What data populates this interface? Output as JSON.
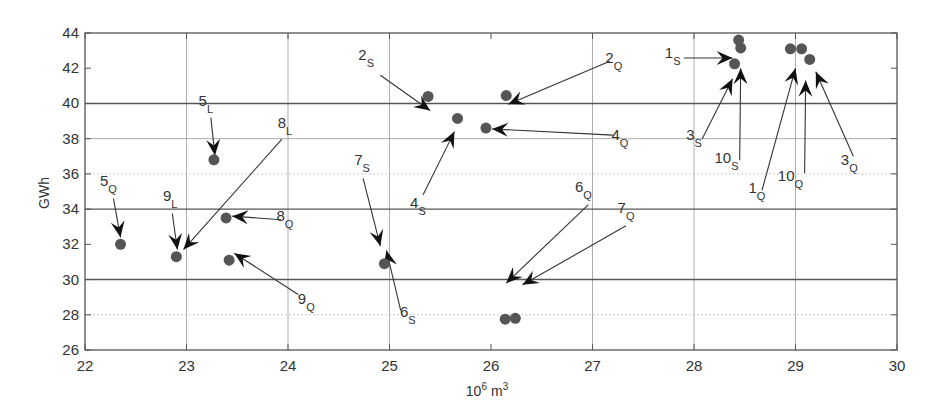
{
  "chart_data": {
    "type": "scatter",
    "title": "",
    "xlabel": "10^6 m^3",
    "xlabel_base": "10",
    "xlabel_exp": "6",
    "xlabel_unit": "m",
    "xlabel_unit_exp": "3",
    "ylabel": "GWh",
    "xlim": [
      22,
      30
    ],
    "ylim": [
      26,
      44
    ],
    "xticks": [
      22,
      23,
      24,
      25,
      26,
      27,
      28,
      29,
      30
    ],
    "yticks": [
      26,
      28,
      30,
      32,
      34,
      36,
      38,
      40,
      42,
      44
    ],
    "grid": {
      "x_lines": [
        23,
        24,
        25,
        27,
        28,
        29
      ],
      "y_heavy": [
        30,
        34,
        40
      ],
      "y_light": [
        38
      ],
      "y_dotted": [
        28,
        36
      ]
    },
    "legend": null,
    "points": [
      {
        "x": 22.35,
        "y": 32.0
      },
      {
        "x": 22.9,
        "y": 31.3
      },
      {
        "x": 23.27,
        "y": 36.8
      },
      {
        "x": 23.39,
        "y": 33.5
      },
      {
        "x": 23.42,
        "y": 31.1
      },
      {
        "x": 24.95,
        "y": 30.9
      },
      {
        "x": 25.38,
        "y": 40.4
      },
      {
        "x": 25.67,
        "y": 39.15
      },
      {
        "x": 25.95,
        "y": 38.6
      },
      {
        "x": 26.15,
        "y": 40.45
      },
      {
        "x": 26.14,
        "y": 27.75
      },
      {
        "x": 26.24,
        "y": 27.8
      },
      {
        "x": 28.44,
        "y": 43.6
      },
      {
        "x": 28.46,
        "y": 43.15
      },
      {
        "x": 28.4,
        "y": 42.25
      },
      {
        "x": 28.95,
        "y": 43.1
      },
      {
        "x": 29.06,
        "y": 43.1
      },
      {
        "x": 29.14,
        "y": 42.5
      }
    ],
    "annotations": [
      {
        "num": "5",
        "sub": "L",
        "label_x": 23.19,
        "label_y": 39.85,
        "from_x": 23.24,
        "from_y": 39.2,
        "to_x": 23.28,
        "to_y": 37.05
      },
      {
        "num": "5",
        "sub": "Q",
        "label_x": 22.23,
        "label_y": 35.3,
        "from_x": 22.28,
        "from_y": 34.6,
        "to_x": 22.35,
        "to_y": 32.4
      },
      {
        "num": "9",
        "sub": "L",
        "label_x": 22.84,
        "label_y": 34.45,
        "from_x": 22.86,
        "from_y": 33.75,
        "to_x": 22.91,
        "to_y": 31.7
      },
      {
        "num": "8",
        "sub": "L",
        "label_x": 23.97,
        "label_y": 38.6,
        "from_x": 23.94,
        "from_y": 37.97,
        "to_x": 22.97,
        "to_y": 31.7
      },
      {
        "num": "8",
        "sub": "Q",
        "label_x": 23.97,
        "label_y": 33.35,
        "from_x": 23.93,
        "from_y": 33.4,
        "to_x": 23.45,
        "to_y": 33.6
      },
      {
        "num": "9",
        "sub": "Q",
        "label_x": 24.18,
        "label_y": 28.6,
        "from_x": 24.1,
        "from_y": 29.15,
        "to_x": 23.47,
        "to_y": 31.5
      },
      {
        "num": "7",
        "sub": "S",
        "label_x": 24.73,
        "label_y": 36.5,
        "from_x": 24.74,
        "from_y": 35.75,
        "to_x": 24.91,
        "to_y": 31.9
      },
      {
        "num": "6",
        "sub": "S",
        "label_x": 25.18,
        "label_y": 27.9,
        "from_x": 25.11,
        "from_y": 28.25,
        "to_x": 24.97,
        "to_y": 31.65
      },
      {
        "num": "2",
        "sub": "S",
        "label_x": 24.77,
        "label_y": 42.45,
        "from_x": 24.91,
        "from_y": 41.6,
        "to_x": 25.4,
        "to_y": 39.6
      },
      {
        "num": "2",
        "sub": "Q",
        "label_x": 27.21,
        "label_y": 42.3,
        "from_x": 27.17,
        "from_y": 42.4,
        "to_x": 26.17,
        "to_y": 39.95
      },
      {
        "num": "4",
        "sub": "S",
        "label_x": 25.28,
        "label_y": 34.05,
        "from_x": 25.33,
        "from_y": 34.8,
        "to_x": 25.64,
        "to_y": 38.4
      },
      {
        "num": "4",
        "sub": "Q",
        "label_x": 27.27,
        "label_y": 37.9,
        "from_x": 27.2,
        "from_y": 38.2,
        "to_x": 26.01,
        "to_y": 38.55
      },
      {
        "num": "6",
        "sub": "Q",
        "label_x": 26.91,
        "label_y": 34.95,
        "from_x": 26.96,
        "from_y": 34.25,
        "to_x": 26.15,
        "to_y": 29.8
      },
      {
        "num": "7",
        "sub": "Q",
        "label_x": 27.33,
        "label_y": 33.8,
        "from_x": 27.33,
        "from_y": 33.05,
        "to_x": 26.31,
        "to_y": 29.7
      },
      {
        "num": "1",
        "sub": "S",
        "label_x": 27.79,
        "label_y": 42.58,
        "from_x": 27.9,
        "from_y": 42.58,
        "to_x": 28.38,
        "to_y": 42.58
      },
      {
        "num": "3",
        "sub": "S",
        "label_x": 28.0,
        "label_y": 37.95,
        "from_x": 28.08,
        "from_y": 37.98,
        "to_x": 28.38,
        "to_y": 41.4
      },
      {
        "num": "10",
        "sub": "S",
        "label_x": 28.32,
        "label_y": 36.6,
        "from_x": 28.45,
        "from_y": 36.78,
        "to_x": 28.46,
        "to_y": 42.0
      },
      {
        "num": "1",
        "sub": "Q",
        "label_x": 28.62,
        "label_y": 34.9,
        "from_x": 28.67,
        "from_y": 35.07,
        "to_x": 29.0,
        "to_y": 42.0
      },
      {
        "num": "10",
        "sub": "Q",
        "label_x": 28.95,
        "label_y": 35.6,
        "from_x": 29.09,
        "from_y": 36.03,
        "to_x": 29.1,
        "to_y": 41.3
      },
      {
        "num": "3",
        "sub": "Q",
        "label_x": 29.53,
        "label_y": 36.5,
        "from_x": 29.57,
        "from_y": 37.0,
        "to_x": 29.2,
        "to_y": 41.8
      }
    ]
  },
  "layout": {
    "plot_left": 85,
    "plot_top": 33,
    "plot_right": 897,
    "plot_bottom": 350,
    "point_color": "#555555",
    "arrow_color": "#111111"
  }
}
